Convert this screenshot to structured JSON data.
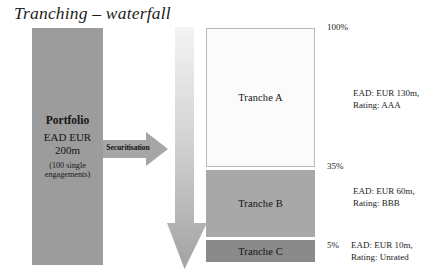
{
  "slide": {
    "title": "Tranching – waterfall"
  },
  "portfolio": {
    "name": "Portfolio",
    "ead_label": "EAD EUR",
    "ead_amount": "200m",
    "note_line1": "(100 single",
    "note_line2": "engagements)"
  },
  "securitisation": {
    "label": "Securitisation",
    "icon": "arrow-right-icon"
  },
  "waterfall": {
    "icon": "arrow-down-icon"
  },
  "tranches": [
    {
      "id": "a",
      "label": "Tranche A"
    },
    {
      "id": "b",
      "label": "Tranche B"
    },
    {
      "id": "c",
      "label": "Tranche C"
    }
  ],
  "scale": {
    "top": "100%",
    "mid": "35%",
    "bottom": "5%"
  },
  "annotations": {
    "tranche_a": {
      "line1": "EAD: EUR 130m,",
      "line2": "Rating: AAA"
    },
    "tranche_b": {
      "line1": "EAD: EUR 60m,",
      "line2": "Rating: BBB"
    },
    "tranche_c": {
      "line1": "EAD: EUR 10m,",
      "line2": "Rating: Unrated"
    }
  },
  "colors": {
    "portfolio_fill": "#9c9c9c",
    "tranche_a_fill": "#fbfbfb",
    "tranche_b_fill": "#a8a8a8",
    "tranche_c_fill": "#8a8a8a",
    "arrow_fill": "#a6a6a6"
  }
}
